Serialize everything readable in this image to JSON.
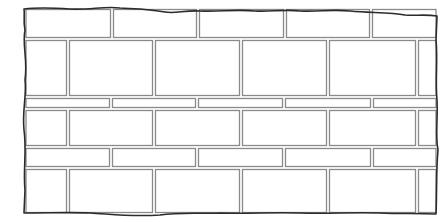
{
  "diagram": {
    "title": "",
    "bond": "running bond with alternating tall and thin courses",
    "colors": {
      "background": "#ffffff",
      "brick_outline": "#8a8a8a",
      "wall_edge": "#2b2b2b"
    },
    "wall": {
      "left": 24,
      "right": 437,
      "top": 8,
      "bottom": 214,
      "gap": 2
    },
    "courses": [
      {
        "name": "course-1",
        "y0": 9,
        "y1": 38,
        "joints": [
          112,
          198,
          285,
          371
        ]
      },
      {
        "name": "course-2",
        "y0": 40,
        "y1": 96,
        "joints": [
          68,
          154,
          241,
          328,
          417
        ]
      },
      {
        "name": "course-3",
        "y0": 98,
        "y1": 108,
        "joints": [
          111,
          197,
          284,
          372
        ]
      },
      {
        "name": "course-4",
        "y0": 110,
        "y1": 146,
        "joints": [
          68,
          154,
          241,
          328,
          417
        ]
      },
      {
        "name": "course-5",
        "y0": 148,
        "y1": 167,
        "joints": [
          111,
          197,
          284,
          372
        ]
      },
      {
        "name": "course-6",
        "y0": 169,
        "y1": 213,
        "joints": [
          68,
          154,
          241,
          328,
          417
        ]
      }
    ]
  }
}
